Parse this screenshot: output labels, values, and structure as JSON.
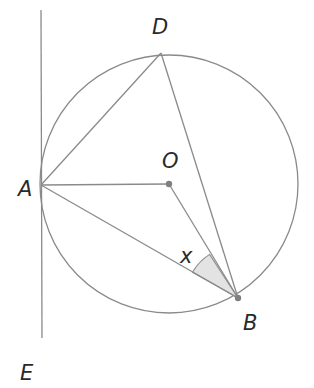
{
  "diagram": {
    "type": "circle-geometry",
    "colors": {
      "stroke": "#8a8a8a",
      "label": "#2a2a2a",
      "angle_fill": "#e3e3e3",
      "point": "#808080"
    },
    "circle": {
      "center_label": "O",
      "cx": 169,
      "cy": 184,
      "r": 129
    },
    "points": {
      "A": {
        "label": "A",
        "x": 41,
        "y": 185
      },
      "B": {
        "label": "B",
        "x": 238,
        "y": 298
      },
      "D": {
        "label": "D",
        "x": 161,
        "y": 53
      },
      "O": {
        "label": "O",
        "x": 169,
        "y": 184
      },
      "E": {
        "label": "E"
      }
    },
    "segments": [
      "AD",
      "DB",
      "AO",
      "OB",
      "AB",
      "tangent AE"
    ],
    "angle_mark": {
      "label": "x",
      "vertex": "B",
      "between": [
        "BA",
        "BO"
      ]
    }
  }
}
